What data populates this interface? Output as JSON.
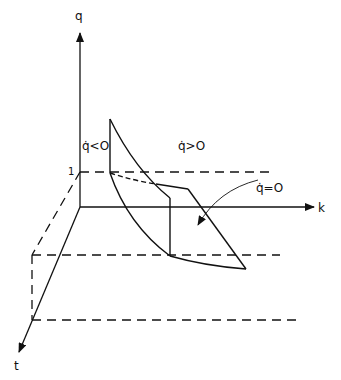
{
  "diagram": {
    "axes": {
      "q_label": "q",
      "k_label": "k",
      "t_label": "t"
    },
    "tick_labels": {
      "one": "1"
    },
    "region_labels": {
      "q_dot_negative": "q̇<O",
      "q_dot_positive": "q̇>O",
      "q_dot_zero": "q̇=O"
    },
    "colors": {
      "line": "#111111",
      "background": "#ffffff"
    }
  }
}
